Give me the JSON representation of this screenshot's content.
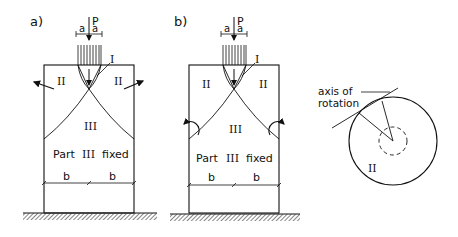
{
  "figure": {
    "panel_a": {
      "label": "a)",
      "load": "P",
      "dim_left": "a",
      "dim_right": "a",
      "region_I": "I",
      "region_II_left": "II",
      "region_II_right": "II",
      "region_III": "III",
      "fixed_text": "Part",
      "fixed_roman": "III",
      "fixed_suffix": "fixed",
      "dim_b_left": "b",
      "dim_b_right": "b"
    },
    "panel_b": {
      "label": "b)",
      "load": "P",
      "dim_left": "a",
      "dim_right": "a",
      "region_I": "I",
      "region_II_left": "II",
      "region_II_right": "II",
      "region_III": "III",
      "fixed_text": "Part",
      "fixed_roman": "III",
      "fixed_suffix": "fixed",
      "dim_b_left": "b",
      "dim_b_right": "b"
    },
    "panel_c": {
      "axis_label_line1": "axis of",
      "axis_label_line2": "rotation",
      "region_II": "II"
    }
  }
}
